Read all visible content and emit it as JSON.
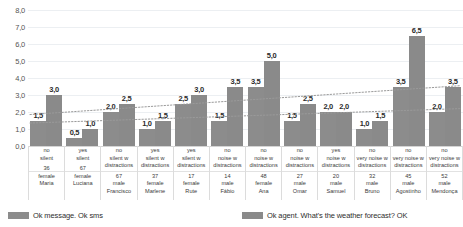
{
  "chart_data": {
    "type": "bar",
    "title": "",
    "subtitle": "",
    "xlabel": "",
    "ylabel": "",
    "ylim": [
      0,
      8
    ],
    "yticks": [
      "0,0",
      "1,0",
      "2,0",
      "3,0",
      "4,0",
      "5,0",
      "6,0",
      "7,0",
      "8,0"
    ],
    "grid": true,
    "legend_position": "bottom",
    "categories": [
      "Maria",
      "Luciana",
      "Francisco",
      "Marlene",
      "Rute",
      "Fábio",
      "Ana",
      "Omar",
      "Samuel",
      "Bruno",
      "Agostinho",
      "Mendonça"
    ],
    "series": [
      {
        "name": "Ok message. Ok sms",
        "color": "#8c8c8c",
        "values": [
          1.5,
          0.5,
          2.0,
          1.0,
          2.5,
          1.5,
          3.5,
          1.5,
          2.0,
          1.0,
          3.5,
          2.0
        ],
        "labels": [
          "1,5",
          "0,5",
          "2,0",
          "1,0",
          "2,5",
          "1,5",
          "3,5",
          "1,5",
          "2,0",
          "1,0",
          "3,5",
          "2,0"
        ]
      },
      {
        "name": "Ok agent. What's the weather forecast? OK",
        "color": "#8a8a8a",
        "values": [
          3.0,
          1.0,
          2.5,
          1.5,
          3.0,
          3.5,
          5.0,
          2.5,
          2.0,
          1.5,
          6.5,
          3.5
        ],
        "labels": [
          "3,0",
          "1,0",
          "2,5",
          "1,5",
          "3,0",
          "3,5",
          "5,0",
          "2,5",
          "2,0",
          "1,5",
          "6,5",
          "3,5"
        ]
      }
    ],
    "trendlines": [
      {
        "name": "trend-series-2",
        "style": "dotted",
        "color": "#9a9a9a",
        "start_value": 1.85,
        "end_value": 3.55
      },
      {
        "name": "trend-series-1",
        "style": "dotted",
        "color": "#9a9a9a",
        "start_value": 1.35,
        "end_value": 2.2
      }
    ],
    "axis_rows": [
      {
        "key": "answer",
        "values": [
          "no",
          "yes",
          "no",
          "yes",
          "yes",
          "no",
          "no",
          "no",
          "yes",
          "no",
          "no",
          "no"
        ]
      },
      {
        "key": "condition",
        "values": [
          "silent",
          "silent",
          "silent w distractions",
          "silent w distractions",
          "silent w distractions",
          "noise w distractions",
          "noise w distractions",
          "noise w distractions",
          "noise w distractions",
          "very noise w distractions",
          "very noise w distractions",
          "very noise w distractions"
        ]
      },
      {
        "key": "age",
        "values": [
          "36",
          "67",
          "67",
          "37",
          "17",
          "14",
          "48",
          "27",
          "20",
          "32",
          "45",
          "52"
        ]
      },
      {
        "key": "gender",
        "values": [
          "female",
          "female",
          "male",
          "female",
          "female",
          "male",
          "female",
          "male",
          "male",
          "male",
          "male",
          "male"
        ]
      },
      {
        "key": "name",
        "values": [
          "Maria",
          "Luciana",
          "Francisco",
          "Marlene",
          "Rute",
          "Fábio",
          "Ana",
          "Omar",
          "Samuel",
          "Bruno",
          "Agostinho",
          "Mendonça"
        ]
      }
    ]
  },
  "legend": {
    "items": [
      {
        "label": "Ok message. Ok sms"
      },
      {
        "label": "Ok agent. What's the weather forecast? OK"
      }
    ]
  }
}
